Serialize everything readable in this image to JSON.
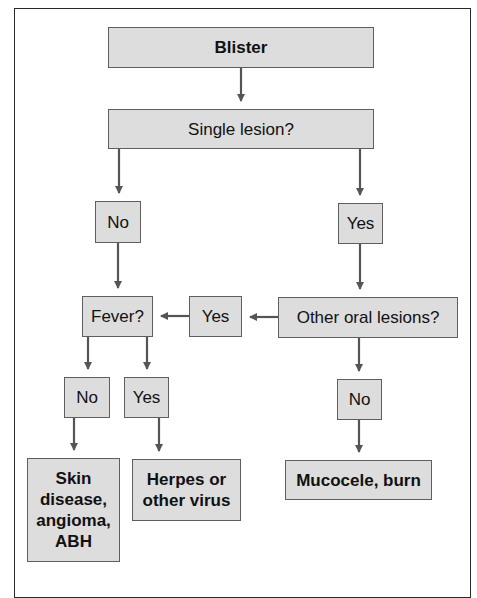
{
  "diagram": {
    "type": "flowchart",
    "colors": {
      "box_fill": "#dddddd",
      "box_border": "#5e5e5e",
      "arrow": "#555555",
      "frame": "#2a2a2a"
    },
    "nodes": {
      "blister": "Blister",
      "single_lesion": "Single lesion?",
      "no_1": "No",
      "yes_1": "Yes",
      "fever": "Fever?",
      "yes_mid": "Yes",
      "other_oral": "Other oral lesions?",
      "fever_no": "No",
      "fever_yes": "Yes",
      "other_no": "No",
      "skin_disease": "Skin disease, angioma, ABH",
      "herpes": "Herpes or other virus",
      "mucocele": "Mucocele, burn"
    },
    "edges": [
      [
        "blister",
        "single_lesion"
      ],
      [
        "single_lesion",
        "no_1"
      ],
      [
        "single_lesion",
        "yes_1"
      ],
      [
        "no_1",
        "fever"
      ],
      [
        "yes_1",
        "other_oral"
      ],
      [
        "other_oral",
        "yes_mid"
      ],
      [
        "yes_mid",
        "fever"
      ],
      [
        "fever",
        "fever_no"
      ],
      [
        "fever",
        "fever_yes"
      ],
      [
        "other_oral",
        "other_no"
      ],
      [
        "fever_no",
        "skin_disease"
      ],
      [
        "fever_yes",
        "herpes"
      ],
      [
        "other_no",
        "mucocele"
      ]
    ]
  }
}
